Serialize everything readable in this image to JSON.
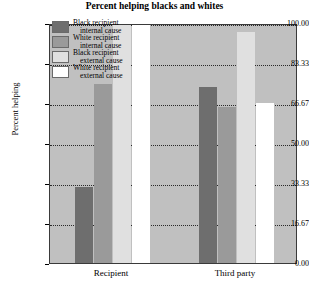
{
  "chart_data": {
    "type": "bar",
    "title": "Percent helping blacks and whites",
    "xlabel": "",
    "ylabel": "Percent helping",
    "categories": [
      "Recipient",
      "Third party"
    ],
    "ylim": [
      0,
      100
    ],
    "yticks": [
      "0.00",
      "16.67",
      "33.33",
      "50.00",
      "66.67",
      "83.33",
      "100.00"
    ],
    "ytick_values": [
      0,
      16.67,
      33.33,
      50.0,
      66.67,
      83.33,
      100.0
    ],
    "grid": true,
    "legend_position": "upper-left-inside",
    "series": [
      {
        "name": "Black recipient internal cause",
        "name_line1": "Black recipient",
        "name_line2": "internal cause",
        "color": "#6e6e6e",
        "values": [
          31.7,
          73.3
        ]
      },
      {
        "name": "White recipient internal cause",
        "name_line1": "White recipient",
        "name_line2": "internal cause",
        "color": "#9a9a9a",
        "values": [
          74.6,
          65.0
        ]
      },
      {
        "name": "Black recipient external cause",
        "name_line1": "Black recipient",
        "name_line2": "external cause",
        "color": "#e0e0e0",
        "values": [
          100.0,
          96.3
        ]
      },
      {
        "name": "White recipient external cause",
        "name_line1": "White recipient",
        "name_line2": "external cause",
        "color": "#ffffff",
        "values": [
          100.0,
          66.7
        ]
      }
    ],
    "plot_background": "#c0c0c0",
    "page_background": "#ffffff"
  }
}
